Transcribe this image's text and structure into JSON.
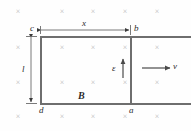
{
  "figure": {
    "background_color": "#fefefe",
    "rail_color": "#6e6e6e",
    "field_mark_color": "#b9b9b9",
    "label_color": "#2b2b2b"
  },
  "labels": {
    "corner_c": "c",
    "corner_b": "b",
    "corner_d": "d",
    "corner_a": "a",
    "dimension_x": "x",
    "dimension_l": "l",
    "field_B": "B",
    "emf": "ε",
    "velocity": "v"
  },
  "field_marks": {
    "glyph": "×",
    "positions": [
      {
        "x": 18,
        "y": 12
      },
      {
        "x": 62,
        "y": 12
      },
      {
        "x": 93,
        "y": 12
      },
      {
        "x": 125,
        "y": 12
      },
      {
        "x": 157,
        "y": 12
      },
      {
        "x": 18,
        "y": 48
      },
      {
        "x": 62,
        "y": 48
      },
      {
        "x": 93,
        "y": 48
      },
      {
        "x": 125,
        "y": 48
      },
      {
        "x": 157,
        "y": 48
      },
      {
        "x": 18,
        "y": 83
      },
      {
        "x": 62,
        "y": 83
      },
      {
        "x": 93,
        "y": 83
      },
      {
        "x": 125,
        "y": 83
      },
      {
        "x": 157,
        "y": 83
      },
      {
        "x": 18,
        "y": 117
      },
      {
        "x": 62,
        "y": 117
      },
      {
        "x": 93,
        "y": 117
      },
      {
        "x": 125,
        "y": 117
      },
      {
        "x": 157,
        "y": 117
      }
    ]
  },
  "geometry": {
    "rail_top_y": 36,
    "rail_bottom_y": 103,
    "rail_left_x": 40,
    "bar_x": 130,
    "rail_right_x": 191
  },
  "chart_data": {
    "type": "diagram",
    "elements": [
      {
        "name": "magnetic-field",
        "symbol": "B",
        "direction": "into page",
        "representation": "grid of x marks"
      },
      {
        "name": "loop-width",
        "symbol": "x",
        "orientation": "horizontal",
        "from": "c",
        "to": "b"
      },
      {
        "name": "loop-height",
        "symbol": "l",
        "orientation": "vertical",
        "from": "c",
        "to": "d"
      },
      {
        "name": "induced-emf",
        "symbol": "ε",
        "direction": "upward",
        "location": "at sliding bar"
      },
      {
        "name": "bar-velocity",
        "symbol": "v",
        "direction": "rightward",
        "location": "right of sliding bar"
      }
    ],
    "corners": [
      "c",
      "b",
      "a",
      "d"
    ]
  }
}
